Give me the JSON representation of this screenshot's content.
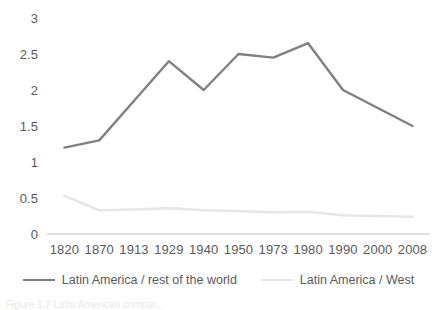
{
  "chart_data": {
    "type": "line",
    "title": "",
    "xlabel": "",
    "ylabel": "",
    "categories": [
      "1820",
      "1870",
      "1913",
      "1929",
      "1940",
      "1950",
      "1973",
      "1980",
      "1990",
      "2000",
      "2008"
    ],
    "series": [
      {
        "name": "Latin America / rest of the world",
        "color": "#808080",
        "values": [
          1.2,
          1.3,
          1.85,
          2.4,
          2.0,
          2.5,
          2.45,
          2.65,
          2.0,
          1.75,
          1.5
        ]
      },
      {
        "name": "Latin America / West",
        "color": "#e6e6e6",
        "values": [
          0.53,
          0.33,
          0.34,
          0.36,
          0.33,
          0.32,
          0.3,
          0.31,
          0.26,
          0.25,
          0.24
        ]
      }
    ],
    "ylim": [
      0,
      3
    ],
    "ytick_values": [
      "0",
      "0.5",
      "1",
      "1.5",
      "2",
      "2.5",
      "3"
    ],
    "ytick_numbers": [
      0,
      0.5,
      1,
      1.5,
      2,
      2.5,
      3
    ],
    "grid": false,
    "legend_position": "bottom",
    "axis_line_color": "#bfbfbf"
  },
  "legend": {
    "entries": [
      {
        "label": "Latin America / rest of the world"
      },
      {
        "label": "Latin America / West"
      }
    ]
  },
  "caption": {
    "fragment": "Figure 1.2  Latin American compar..."
  }
}
